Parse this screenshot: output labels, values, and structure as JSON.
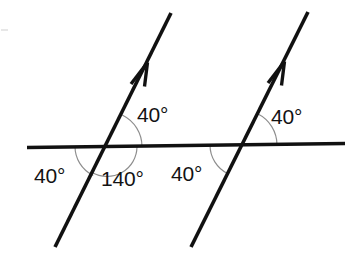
{
  "figure": {
    "background_color": "#ffffff",
    "line_color": "#111111",
    "arc_color": "#8d8d8d",
    "label_color": "#131313",
    "width": 351,
    "height": 256
  },
  "lines": {
    "horizontal": {
      "name": "horizontal transversal line",
      "x1": 27,
      "y1": 147.5,
      "x2": 345,
      "y2": 143.5,
      "stroke_width": 3.4
    },
    "transversal_left": {
      "name": "left parallel line with arrow",
      "x1": 55,
      "y1": 247,
      "x2": 171,
      "y2": 13,
      "stroke_width": 3.6,
      "arrow_tip_x": 150,
      "arrow_tip_y": 56
    },
    "transversal_right": {
      "name": "right parallel line with arrow",
      "x1": 191,
      "y1": 247,
      "x2": 308,
      "y2": 12,
      "stroke_width": 3.6,
      "arrow_tip_x": 287,
      "arrow_tip_y": 55
    }
  },
  "intersections": [
    {
      "name": "left-intersection",
      "x": 107,
      "y": 146.5
    },
    {
      "name": "right-intersection",
      "x": 242,
      "y": 145
    }
  ],
  "labels": [
    {
      "id": "angle-upper-left-node",
      "text": "40°",
      "x": 137,
      "y": 122,
      "anchor": "start"
    },
    {
      "id": "angle-lower-left-node",
      "text": "140°",
      "x": 101,
      "y": 186,
      "anchor": "start"
    },
    {
      "id": "angle-left-of-left-node",
      "text": "40°",
      "x": 34,
      "y": 183,
      "anchor": "start"
    },
    {
      "id": "angle-left-of-right-node",
      "text": "40°",
      "x": 171,
      "y": 181,
      "anchor": "start"
    },
    {
      "id": "angle-upper-right-node",
      "text": "40°",
      "x": 271,
      "y": 124,
      "anchor": "start"
    }
  ],
  "arcs": [
    {
      "id": "arc-left-upper",
      "cx": 107,
      "cy": 146.5,
      "r": 35,
      "start_deg": 0,
      "end_deg": 63.5,
      "description": "40 degree arc above horizontal at left intersection"
    },
    {
      "id": "arc-left-lower",
      "cx": 107,
      "cy": 146.5,
      "r": 30,
      "start_deg": 0,
      "end_deg": -180,
      "description": "140 degree reflex-side arc below horizontal at left intersection"
    },
    {
      "id": "arc-left-west",
      "cx": 107,
      "cy": 146.5,
      "r": 32,
      "start_deg": 180,
      "end_deg": 243.5,
      "description": "40 degree arc left of left intersection"
    },
    {
      "id": "arc-right-upper",
      "cx": 242,
      "cy": 145,
      "r": 35,
      "start_deg": 0,
      "end_deg": 63.5,
      "description": "40 degree arc above horizontal at right intersection"
    },
    {
      "id": "arc-right-west",
      "cx": 242,
      "cy": 145,
      "r": 32,
      "start_deg": 180,
      "end_deg": 243.5,
      "description": "40 degree arc left of right intersection"
    }
  ],
  "angle_values": {
    "upper_left": "40°",
    "lower_left": "140°",
    "west_left": "40°",
    "west_right": "40°",
    "upper_right": "40°"
  }
}
